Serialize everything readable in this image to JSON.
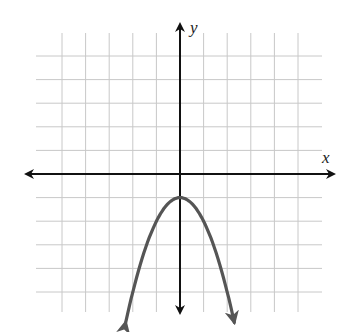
{
  "chart_data": {
    "type": "line",
    "title": "",
    "xlabel": "x",
    "ylabel": "y",
    "xlim": [
      -6,
      6
    ],
    "ylim": [
      -6,
      6
    ],
    "grid": true,
    "grid_range": {
      "x": [
        -5,
        5
      ],
      "y": [
        -5,
        5
      ]
    },
    "tick_labels": [],
    "legend": null,
    "series": [
      {
        "name": "parabola",
        "equation": "y = -x^2 - 1",
        "vertex": [
          0,
          -1
        ],
        "opens": "down",
        "arrows_on_ends": true,
        "x": [
          -2.3,
          -2,
          -1.5,
          -1,
          -0.5,
          0,
          0.5,
          1,
          1.5,
          2,
          2.3
        ],
        "y": [
          -6.29,
          -5,
          -3.25,
          -2,
          -1.25,
          -1,
          -1.25,
          -2,
          -3.25,
          -5,
          -6.29
        ],
        "color": "#555555"
      }
    ]
  },
  "labels": {
    "x_axis": "x",
    "y_axis": "y"
  },
  "colors": {
    "grid": "#c8c8c8",
    "axis": "#111111",
    "curve": "#555555"
  }
}
